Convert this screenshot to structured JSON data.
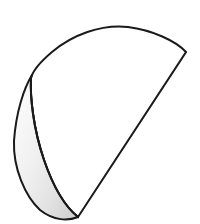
{
  "figure": {
    "name": "cone-sector-line-drawing",
    "title": "Cone sector with shaded crescent",
    "background_color": "#ffffff",
    "canvas": {
      "width": 200,
      "height": 224
    },
    "stroke": {
      "color": "#1a1a1a",
      "width": 2,
      "linejoin": "miter",
      "linecap": "round"
    },
    "shapes": {
      "sector": {
        "name": "main-sector-body",
        "fill": "#ffffff",
        "description": "Circular sector resembling a rolled cone, white fill",
        "path": "M 78 217 L 186 52 C 176 41 152 30 128 27 C 101 24 72 35 52 52 C 39 63 33 70 31 78 C 30 96 33 128 44 160 C 55 192 68 209 78 217 Z",
        "vertices": {
          "apex": {
            "x": 78,
            "y": 217
          },
          "right_corner": {
            "x": 186,
            "y": 52
          },
          "arc_top": {
            "x": 110,
            "y": 27
          },
          "arc_left": {
            "x": 31,
            "y": 78
          }
        }
      },
      "crescent": {
        "name": "shaded-crescent-lune",
        "fill_from": "#fcfcfc",
        "fill_to": "#d4d4d4",
        "description": "Gray shaded lune on the lower left showing the hidden inner surface",
        "path": "M 32 75 C 24 88 16 112 14 141 C 13 168 25 196 40 210 C 54 221 68 221 78 217 C 68 209 55 192 44 160 C 33 128 30 96 31 78 Z",
        "vertices": {
          "top": {
            "x": 32,
            "y": 75
          },
          "leftmost": {
            "x": 14,
            "y": 141
          },
          "bottom": {
            "x": 78,
            "y": 217
          }
        }
      }
    }
  }
}
